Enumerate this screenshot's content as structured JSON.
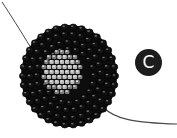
{
  "figure": {
    "step_label": "C",
    "colors": {
      "outer_beads": "#111111",
      "bead_highlight": "#8a8a8a",
      "center_beads": "#b8b8b8",
      "center_bead_highlight": "#e6e6e6",
      "thread": "#4a4a4a",
      "badge_bg": "#1c1c1c",
      "badge_text": "#ffffff"
    }
  }
}
